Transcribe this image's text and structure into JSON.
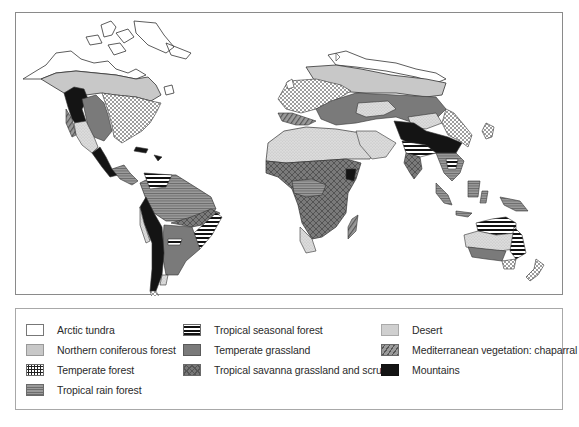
{
  "figure": {
    "type": "world biome map",
    "legend": {
      "columns": [
        [
          {
            "key": "arctic_tundra",
            "label": "Arctic tundra",
            "fill": "#ffffff",
            "pattern": "plain"
          },
          {
            "key": "northern_coniferous_forest",
            "label": "Northern coniferous forest",
            "fill": "#c8c8c8",
            "pattern": "plain"
          },
          {
            "key": "temperate_forest",
            "label": "Temperate forest",
            "fill": "#ffffff",
            "pattern": "dots"
          },
          {
            "key": "tropical_rain_forest",
            "label": "Tropical rain forest",
            "fill": "#8c8c8c",
            "pattern": "fine-horizontal-lines"
          }
        ],
        [
          {
            "key": "tropical_seasonal_forest",
            "label": "Tropical seasonal forest",
            "fill": "#111111",
            "pattern": "bold-horizontal-stripes"
          },
          {
            "key": "temperate_grassland",
            "label": "Temperate grassland",
            "fill": "#7a7a7a",
            "pattern": "plain"
          },
          {
            "key": "tropical_savanna",
            "label": "Tropical savanna grassland and scrub",
            "fill": "#777777",
            "pattern": "crosshatch"
          }
        ],
        [
          {
            "key": "desert",
            "label": "Desert",
            "fill": "#e0e0e0",
            "pattern": "fine-stipple"
          },
          {
            "key": "mediterranean",
            "label": "Mediterranean vegetation: chaparral",
            "fill": "#9a9a9a",
            "pattern": "diagonal-lines"
          },
          {
            "key": "mountains",
            "label": "Mountains",
            "fill": "#141414",
            "pattern": "plain"
          }
        ]
      ]
    },
    "regions_depicted": [
      "North America",
      "Central America",
      "South America",
      "Europe",
      "Africa",
      "Asia",
      "Southeast Asia",
      "Australia",
      "New Zealand"
    ]
  }
}
